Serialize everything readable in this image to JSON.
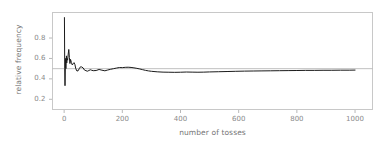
{
  "chart_data": {
    "type": "line",
    "title": "",
    "xlabel": "number of tosses",
    "ylabel": "relative frequency",
    "xlim": [
      -40,
      1060
    ],
    "ylim": [
      0.1,
      1.05
    ],
    "xticks": [
      0,
      200,
      400,
      600,
      800,
      1000
    ],
    "xtick_labels": [
      "0",
      "200",
      "400",
      "600",
      "800",
      "1000"
    ],
    "yticks": [
      0.2,
      0.4,
      0.6,
      0.8
    ],
    "ytick_labels": [
      "0.2",
      "0.4",
      "0.6",
      "0.8"
    ],
    "grid": false,
    "legend": null,
    "reference_lines": [
      {
        "orientation": "horizontal",
        "value": 0.5,
        "color": "#b0b0b0"
      }
    ],
    "series": [
      {
        "name": "relative frequency of heads",
        "color": "#1a1a1a",
        "x": [
          1,
          2,
          3,
          4,
          5,
          6,
          7,
          8,
          9,
          10,
          12,
          14,
          16,
          18,
          20,
          22,
          25,
          28,
          31,
          34,
          37,
          40,
          44,
          48,
          52,
          56,
          60,
          65,
          70,
          75,
          80,
          85,
          90,
          95,
          100,
          110,
          120,
          130,
          140,
          150,
          160,
          170,
          180,
          190,
          200,
          210,
          220,
          230,
          240,
          250,
          260,
          270,
          280,
          290,
          300,
          320,
          340,
          360,
          380,
          400,
          420,
          440,
          460,
          480,
          500,
          530,
          560,
          590,
          620,
          650,
          680,
          710,
          740,
          770,
          800,
          830,
          860,
          890,
          920,
          950,
          980,
          1000
        ],
        "y": [
          1.0,
          0.5,
          0.333,
          0.5,
          0.6,
          0.5,
          0.571,
          0.625,
          0.556,
          0.6,
          0.583,
          0.643,
          0.688,
          0.611,
          0.55,
          0.591,
          0.56,
          0.536,
          0.548,
          0.559,
          0.541,
          0.5,
          0.477,
          0.479,
          0.5,
          0.518,
          0.517,
          0.508,
          0.486,
          0.48,
          0.475,
          0.482,
          0.489,
          0.484,
          0.48,
          0.482,
          0.492,
          0.485,
          0.479,
          0.487,
          0.494,
          0.5,
          0.506,
          0.511,
          0.51,
          0.513,
          0.514,
          0.512,
          0.508,
          0.503,
          0.497,
          0.49,
          0.483,
          0.478,
          0.474,
          0.469,
          0.466,
          0.465,
          0.464,
          0.465,
          0.467,
          0.466,
          0.465,
          0.466,
          0.468,
          0.47,
          0.472,
          0.474,
          0.476,
          0.477,
          0.478,
          0.479,
          0.48,
          0.481,
          0.482,
          0.483,
          0.483,
          0.484,
          0.484,
          0.485,
          0.485,
          0.486
        ]
      }
    ]
  },
  "axes": {
    "frame_color": "#c8c8c8",
    "tick_color": "#b8b8b8",
    "background": "#ffffff"
  }
}
